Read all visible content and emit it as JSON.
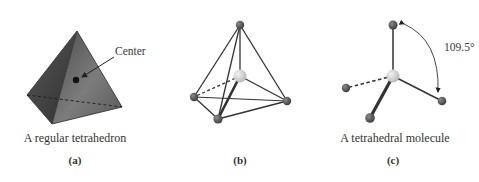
{
  "panels": [
    {
      "id": "a",
      "label": "(a)",
      "caption": "A regular tetrahedron",
      "annotation": "Center"
    },
    {
      "id": "b",
      "label": "(b)",
      "caption": ""
    },
    {
      "id": "c",
      "label": "(c)",
      "caption": "A tetrahedral molecule",
      "angle_label": "109.5°"
    }
  ],
  "colors": {
    "solid_face_dark": "#3c3c3c",
    "solid_face_light": "#8a8a8a",
    "atom_outer": "#555555",
    "atom_center": "#d6d6d6",
    "bond": "#333333"
  }
}
